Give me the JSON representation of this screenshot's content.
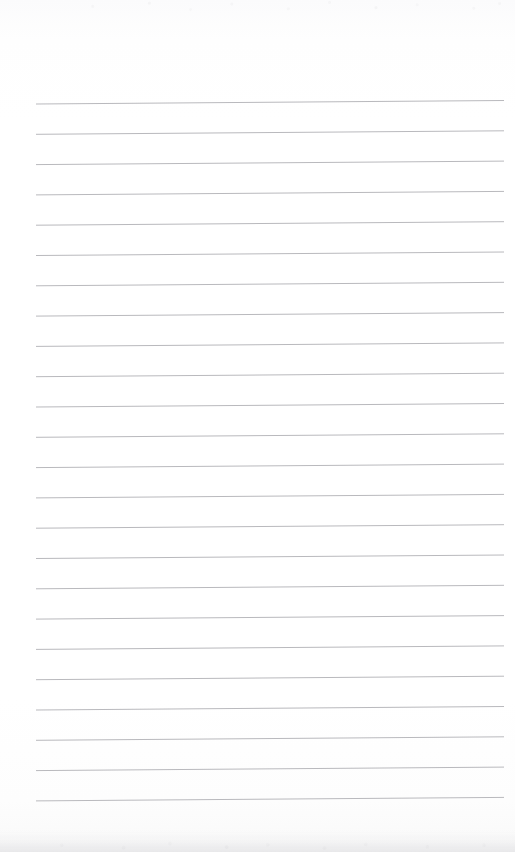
{
  "document": {
    "kind": "scanned-lined-notebook-page",
    "title": "Blank lined notebook page",
    "page_width": 515,
    "page_height": 852,
    "background_color": "#fefefe",
    "has_text_content": false,
    "text_content": "",
    "margin_rule": false,
    "holes": false
  },
  "ruling": {
    "line_count": 24,
    "line_color": "#b9b9bd",
    "line_thickness_px": 1,
    "first_line_y": 104,
    "line_spacing_px": 30.3,
    "left_x": 36,
    "right_x": 504,
    "right_end_rise_px": 3.5,
    "lines": [
      {
        "index": 1,
        "y_left": 104.0,
        "y_right": 100.5
      },
      {
        "index": 2,
        "y_left": 134.3,
        "y_right": 130.8
      },
      {
        "index": 3,
        "y_left": 164.6,
        "y_right": 161.1
      },
      {
        "index": 4,
        "y_left": 194.9,
        "y_right": 191.4
      },
      {
        "index": 5,
        "y_left": 225.2,
        "y_right": 221.7
      },
      {
        "index": 6,
        "y_left": 255.5,
        "y_right": 252.0
      },
      {
        "index": 7,
        "y_left": 285.8,
        "y_right": 282.3
      },
      {
        "index": 8,
        "y_left": 316.1,
        "y_right": 312.6
      },
      {
        "index": 9,
        "y_left": 346.4,
        "y_right": 342.9
      },
      {
        "index": 10,
        "y_left": 376.7,
        "y_right": 373.2
      },
      {
        "index": 11,
        "y_left": 407.0,
        "y_right": 403.5
      },
      {
        "index": 12,
        "y_left": 437.3,
        "y_right": 433.8
      },
      {
        "index": 13,
        "y_left": 467.6,
        "y_right": 464.1
      },
      {
        "index": 14,
        "y_left": 497.9,
        "y_right": 494.4
      },
      {
        "index": 15,
        "y_left": 528.2,
        "y_right": 524.7
      },
      {
        "index": 16,
        "y_left": 558.5,
        "y_right": 555.0
      },
      {
        "index": 17,
        "y_left": 588.8,
        "y_right": 585.3
      },
      {
        "index": 18,
        "y_left": 619.1,
        "y_right": 615.6
      },
      {
        "index": 19,
        "y_left": 649.4,
        "y_right": 645.9
      },
      {
        "index": 20,
        "y_left": 679.7,
        "y_right": 676.2
      },
      {
        "index": 21,
        "y_left": 710.0,
        "y_right": 706.5
      },
      {
        "index": 22,
        "y_left": 740.3,
        "y_right": 736.8
      },
      {
        "index": 23,
        "y_left": 770.6,
        "y_right": 767.1
      },
      {
        "index": 24,
        "y_left": 800.9,
        "y_right": 797.4
      }
    ]
  },
  "scan_artifacts": {
    "top_noise_band_height": 16,
    "bottom_shadow_band_height": 22,
    "shadow_color": "#c4c4c9"
  }
}
